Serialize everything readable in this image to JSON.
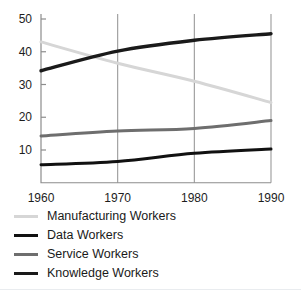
{
  "chart_data": {
    "type": "line",
    "title": "",
    "subtitle": "",
    "xlabel": "",
    "ylabel": "",
    "x": [
      1960,
      1970,
      1980,
      1990
    ],
    "categories": [
      "1960",
      "1970",
      "1980",
      "1990"
    ],
    "xlim": [
      1960,
      1990
    ],
    "ylim": [
      0,
      50
    ],
    "yticks": [
      10,
      20,
      30,
      40,
      50
    ],
    "ytick_labels": [
      "10",
      "20",
      "30",
      "40",
      "50"
    ],
    "xticks": [
      1960,
      1970,
      1980,
      1990
    ],
    "xtick_labels": [
      "1960",
      "1970",
      "1980",
      "1990"
    ],
    "grid": "vertical-only",
    "legend_position": "below",
    "series": [
      {
        "name": "Manufacturing Workers",
        "color": "#d6d6d6",
        "width": 3.0,
        "values": [
          43.0,
          36.5,
          31.0,
          24.5
        ]
      },
      {
        "name": "Data Workers",
        "color": "#111111",
        "width": 3.0,
        "values": [
          5.5,
          6.5,
          9.0,
          10.3
        ]
      },
      {
        "name": "Service Workers",
        "color": "#6e6e6e",
        "width": 3.0,
        "values": [
          14.3,
          15.8,
          16.6,
          19.0
        ]
      },
      {
        "name": "Knowledge Workers",
        "color": "#1a1a1a",
        "width": 3.4,
        "values": [
          34.2,
          40.2,
          43.5,
          45.5
        ]
      }
    ]
  },
  "axes": {
    "axis_color": "#8d8d8d",
    "gridline_color": "#9a9a9a",
    "tick_color": "#8d8d8d"
  },
  "legend": {
    "items": [
      {
        "label": "Manufacturing Workers",
        "color": "#d6d6d6",
        "thickness": "3px"
      },
      {
        "label": "Data Workers",
        "color": "#111111",
        "thickness": "3px"
      },
      {
        "label": "Service Workers",
        "color": "#6e6e6e",
        "thickness": "3px"
      },
      {
        "label": "Knowledge Workers",
        "color": "#1a1a1a",
        "thickness": "3.5px"
      }
    ]
  }
}
